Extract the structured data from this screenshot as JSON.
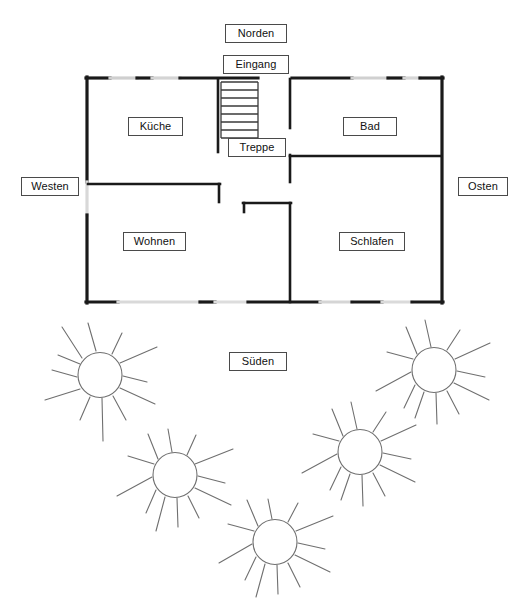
{
  "diagram": {
    "type": "floor-plan-with-sun-path",
    "title_text": "",
    "background_color": "#ffffff",
    "line_color": "#1a1a1a",
    "sun_line_color": "#6a6a6a",
    "label_border_color": "#4a4a4a"
  },
  "compass": {
    "north": "Norden",
    "south": "Süden",
    "east": "Osten",
    "west": "Westen"
  },
  "entrance": {
    "label": "Eingang"
  },
  "rooms": [
    {
      "key": "kueche",
      "label": "Küche"
    },
    {
      "key": "bad",
      "label": "Bad"
    },
    {
      "key": "wohnen",
      "label": "Wohnen"
    },
    {
      "key": "schlafen",
      "label": "Schlafen"
    },
    {
      "key": "treppe",
      "label": "Treppe"
    }
  ],
  "stairs": {
    "label": "Treppe",
    "step_count": 7
  },
  "suns": {
    "count": 5,
    "positions": [
      {
        "id": "sun-1",
        "cx": 100,
        "cy": 375,
        "r": 22,
        "rays": 12
      },
      {
        "id": "sun-2",
        "cx": 175,
        "cy": 475,
        "r": 22,
        "rays": 12
      },
      {
        "id": "sun-3",
        "cx": 275,
        "cy": 542,
        "r": 22,
        "rays": 12
      },
      {
        "id": "sun-4",
        "cx": 360,
        "cy": 452,
        "r": 22,
        "rays": 12
      },
      {
        "id": "sun-5",
        "cx": 434,
        "cy": 370,
        "r": 22,
        "rays": 12
      }
    ]
  }
}
